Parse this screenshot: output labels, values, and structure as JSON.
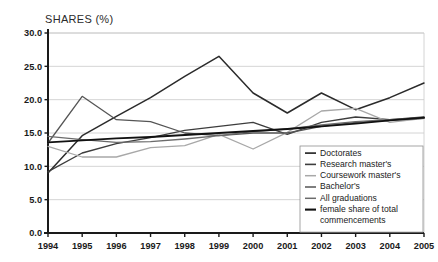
{
  "page": {
    "cut_title": "",
    "axis_title": "SHARES (%)"
  },
  "chart_data": {
    "type": "line",
    "title": "SHARES (%)",
    "xlabel": "",
    "ylabel": "SHARES (%)",
    "grid": true,
    "legend_position": "inside-bottom-right",
    "xlim": [
      1994,
      2005
    ],
    "ylim": [
      0.0,
      30.0
    ],
    "ytick_labels": [
      "30.0",
      "25.0",
      "20.0",
      "15.0",
      "10.0",
      "5.0",
      "0.0"
    ],
    "yticks": [
      30.0,
      25.0,
      20.0,
      15.0,
      10.0,
      5.0,
      0.0
    ],
    "categories": [
      1994,
      1995,
      1996,
      1997,
      1998,
      1999,
      2000,
      2001,
      2002,
      2003,
      2004,
      2005
    ],
    "xtick_labels": [
      "1994",
      "1995",
      "1996",
      "1997",
      "1998",
      "1999",
      "2000",
      "2001",
      "2002",
      "2003",
      "2004",
      "2005"
    ],
    "series": [
      {
        "name": "Doctorates",
        "color": "#2b2b2b",
        "width": 1.5,
        "values": [
          9.0,
          14.6,
          17.5,
          20.3,
          23.5,
          26.5,
          21.0,
          18.0,
          21.0,
          18.5,
          20.3,
          22.5
        ]
      },
      {
        "name": "Research master's",
        "color": "#3d3d3d",
        "width": 1.4,
        "values": [
          9.2,
          12.0,
          13.4,
          14.3,
          15.4,
          16.0,
          16.6,
          14.8,
          16.6,
          17.4,
          17.0,
          17.4
        ]
      },
      {
        "name": "Coursework master's",
        "color": "#a8a8a8",
        "width": 1.3,
        "values": [
          13.0,
          11.4,
          11.4,
          12.8,
          13.1,
          14.8,
          12.6,
          15.1,
          18.3,
          18.7,
          16.6,
          17.2
        ]
      },
      {
        "name": "Bachelor's",
        "color": "#555555",
        "width": 1.3,
        "values": [
          13.5,
          20.5,
          17.0,
          16.7,
          15.0,
          14.6,
          15.0,
          15.0,
          16.0,
          16.6,
          16.9,
          17.2
        ]
      },
      {
        "name": "All graduations",
        "color": "#6b6b6b",
        "width": 1.3,
        "values": [
          14.5,
          14.0,
          13.6,
          13.7,
          14.1,
          14.6,
          15.2,
          15.6,
          16.2,
          16.7,
          17.0,
          17.3
        ]
      },
      {
        "name": "female share of total commencements",
        "color": "#111111",
        "width": 1.9,
        "values": [
          13.6,
          13.9,
          14.2,
          14.4,
          14.7,
          15.0,
          15.3,
          15.6,
          16.0,
          16.4,
          16.9,
          17.3
        ]
      }
    ],
    "legend": [
      "Doctorates",
      "Research master's",
      "Coursework master's",
      "Bachelor's",
      "All graduations",
      "female share of total",
      "commencements"
    ]
  }
}
